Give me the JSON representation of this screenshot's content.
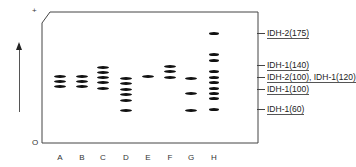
{
  "figure": {
    "plus_label": "+",
    "origin_label": "O",
    "lanes": [
      {
        "label": "A",
        "x": 60,
        "bands": [
          76,
          81,
          86
        ]
      },
      {
        "label": "B",
        "x": 82,
        "bands": [
          76,
          81,
          86
        ]
      },
      {
        "label": "C",
        "x": 103,
        "bands": [
          67,
          72,
          77,
          82,
          88
        ]
      },
      {
        "label": "D",
        "x": 126,
        "bands": [
          78,
          83,
          89,
          94,
          100,
          110
        ]
      },
      {
        "label": "E",
        "x": 148,
        "bands": [
          76
        ]
      },
      {
        "label": "F",
        "x": 170,
        "bands": [
          66,
          71,
          77
        ]
      },
      {
        "label": "G",
        "x": 191,
        "bands": [
          78,
          93,
          110
        ]
      },
      {
        "label": "H",
        "x": 214,
        "bands": [
          33,
          54,
          60,
          71,
          77,
          82,
          88,
          93,
          98,
          109
        ]
      }
    ],
    "annotations": [
      {
        "text": "IDH-2(175)",
        "y": 33
      },
      {
        "text": "IDH-1(140)",
        "y": 65
      },
      {
        "text": "IDH-2(100), IDH-1(120)",
        "y": 77
      },
      {
        "text": "IDH-1(100)",
        "y": 89
      },
      {
        "text": "IDH-1(60)",
        "y": 109
      }
    ]
  }
}
